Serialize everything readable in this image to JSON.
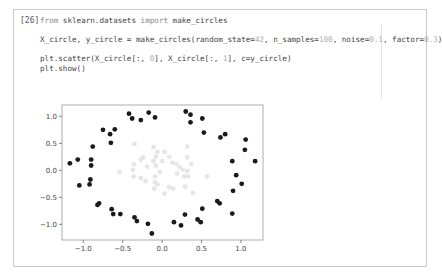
{
  "heading": "",
  "cell": {
    "execution_count": "[26]",
    "code_lines": [
      {
        "parts": [
          {
            "t": "from ",
            "c": "kw"
          },
          {
            "t": "sklearn.datasets ",
            "c": ""
          },
          {
            "t": "import ",
            "c": "kw"
          },
          {
            "t": "make_circles",
            "c": ""
          }
        ]
      },
      {
        "parts": []
      },
      {
        "parts": [
          {
            "t": "X_circle, y_circle = make_circles(random_state=",
            "c": ""
          },
          {
            "t": "42",
            "c": "num"
          },
          {
            "t": ", n_samples=",
            "c": ""
          },
          {
            "t": "100",
            "c": "num"
          },
          {
            "t": ", noise=",
            "c": ""
          },
          {
            "t": "0.1",
            "c": "num"
          },
          {
            "t": ", factor=",
            "c": ""
          },
          {
            "t": "0.3",
            "c": "num"
          },
          {
            "t": ")",
            "c": ""
          }
        ]
      },
      {
        "parts": []
      },
      {
        "parts": [
          {
            "t": "plt.scatter(X_circle[:, ",
            "c": ""
          },
          {
            "t": "0",
            "c": "num"
          },
          {
            "t": "], X_circle[:, ",
            "c": ""
          },
          {
            "t": "1",
            "c": "num"
          },
          {
            "t": "], c=y_circle)",
            "c": ""
          }
        ]
      },
      {
        "parts": [
          {
            "t": "plt.show()",
            "c": ""
          }
        ]
      }
    ]
  },
  "chart_data": {
    "type": "scatter",
    "title": "",
    "xlabel": "",
    "ylabel": "",
    "xlim": [
      -1.27,
      1.28
    ],
    "ylim": [
      -1.29,
      1.21
    ],
    "xticks": [
      -1.0,
      -0.5,
      0.0,
      0.5,
      1.0
    ],
    "xtick_labels": [
      "−1.0",
      "−0.5",
      "0.0",
      "0.5",
      "1.0"
    ],
    "yticks": [
      1.0,
      0.5,
      0.0,
      -0.5,
      -1.0
    ],
    "ytick_labels": [
      "1.0",
      "0.5",
      "0.0",
      "−0.5",
      "−1.0"
    ],
    "grid": false,
    "series": [
      {
        "name": "outer (class 0)",
        "color": "#1a1a1a",
        "points": [
          [
            -1.17,
            0.13
          ],
          [
            -1.07,
            0.2
          ],
          [
            -0.9,
            0.2
          ],
          [
            -0.9,
            0.09
          ],
          [
            -0.88,
            0.44
          ],
          [
            -0.75,
            0.75
          ],
          [
            -0.66,
            0.67
          ],
          [
            -0.6,
            0.76
          ],
          [
            -0.65,
            0.51
          ],
          [
            -0.42,
            1.05
          ],
          [
            -0.38,
            0.96
          ],
          [
            -0.27,
            0.93
          ],
          [
            -0.17,
            1.07
          ],
          [
            -0.09,
            0.98
          ],
          [
            -1.05,
            -0.28
          ],
          [
            -0.91,
            -0.17
          ],
          [
            -0.92,
            -0.26
          ],
          [
            -0.82,
            -0.64
          ],
          [
            -0.8,
            -0.61
          ],
          [
            -0.64,
            -0.72
          ],
          [
            -0.62,
            -0.81
          ],
          [
            -0.53,
            -0.81
          ],
          [
            -0.35,
            -0.87
          ],
          [
            -0.32,
            -0.94
          ],
          [
            -0.18,
            -0.99
          ],
          [
            -0.13,
            -1.17
          ],
          [
            0.3,
            1.09
          ],
          [
            0.36,
            1.03
          ],
          [
            0.36,
            0.89
          ],
          [
            0.51,
            0.96
          ],
          [
            0.53,
            0.7
          ],
          [
            0.74,
            0.61
          ],
          [
            0.8,
            0.67
          ],
          [
            1.06,
            0.57
          ],
          [
            1.05,
            0.38
          ],
          [
            0.89,
            0.17
          ],
          [
            1.18,
            0.17
          ],
          [
            0.94,
            -0.09
          ],
          [
            1.01,
            -0.25
          ],
          [
            0.9,
            -0.38
          ],
          [
            0.7,
            -0.57
          ],
          [
            0.73,
            -0.61
          ],
          [
            0.89,
            -0.8
          ],
          [
            0.51,
            -0.71
          ],
          [
            0.29,
            -0.82
          ],
          [
            0.45,
            -0.91
          ],
          [
            0.49,
            -0.96
          ],
          [
            0.15,
            -0.96
          ],
          [
            0.24,
            -1.02
          ]
        ]
      },
      {
        "name": "inner (class 1)",
        "color": "#e6e6e6",
        "points": [
          [
            -0.35,
            0.49
          ],
          [
            -0.11,
            0.43
          ],
          [
            -0.06,
            0.34
          ],
          [
            0.03,
            0.34
          ],
          [
            0.32,
            0.44
          ],
          [
            -0.24,
            0.24
          ],
          [
            -0.27,
            0.2
          ],
          [
            -0.08,
            0.25
          ],
          [
            0.09,
            0.25
          ],
          [
            -0.11,
            0.17
          ],
          [
            0.0,
            0.17
          ],
          [
            0.13,
            0.14
          ],
          [
            0.18,
            0.12
          ],
          [
            0.32,
            0.24
          ],
          [
            0.37,
            0.12
          ],
          [
            -0.36,
            0.11
          ],
          [
            -0.19,
            0.07
          ],
          [
            -0.08,
            0.09
          ],
          [
            0.22,
            0.06
          ],
          [
            0.26,
            0.01
          ],
          [
            -0.54,
            -0.03
          ],
          [
            -0.37,
            0.01
          ],
          [
            -0.03,
            -0.03
          ],
          [
            0.19,
            -0.06
          ],
          [
            0.32,
            -0.01
          ],
          [
            -0.36,
            -0.11
          ],
          [
            -0.27,
            -0.14
          ],
          [
            -0.09,
            -0.11
          ],
          [
            0.28,
            -0.11
          ],
          [
            0.33,
            -0.11
          ],
          [
            -0.21,
            -0.2
          ],
          [
            -0.09,
            -0.22
          ],
          [
            -0.06,
            -0.26
          ],
          [
            -0.1,
            -0.34
          ],
          [
            0.09,
            -0.31
          ],
          [
            0.14,
            -0.34
          ],
          [
            0.29,
            -0.3
          ],
          [
            0.03,
            -0.43
          ],
          [
            0.39,
            -0.42
          ],
          [
            0.57,
            -0.11
          ]
        ]
      }
    ]
  }
}
